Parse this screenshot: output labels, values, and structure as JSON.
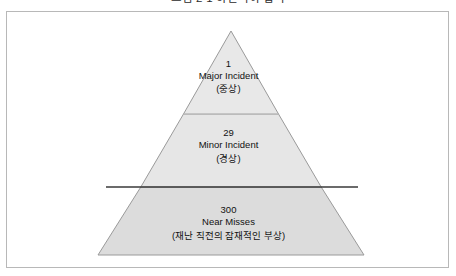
{
  "top_caption": {
    "text": "그림 2-1  하인리히 법칙",
    "note": "clipped-at-top-edge"
  },
  "figure": {
    "name": "heinrich-safety-pyramid",
    "background": "#ffffff",
    "border_color": "#b8b8b8"
  },
  "pyramid": {
    "apex": {
      "x": 230,
      "y": 19
    },
    "base": {
      "left_x": 91,
      "right_x": 357,
      "y": 243
    },
    "divider_y": [
      102,
      175
    ],
    "tiers": [
      {
        "id": "major-incident",
        "count": "1",
        "label": "Major Incident",
        "sub": "(중상)",
        "fill": "#e8e8e8"
      },
      {
        "id": "minor-incident",
        "count": "29",
        "label": "Minor Incident",
        "sub": "(경상)",
        "fill": "#e6e6e6"
      },
      {
        "id": "near-misses",
        "count": "300",
        "label": "Near Misses",
        "sub": "(재난 직전의 잠재적인 부상)",
        "fill": "#dcdcdc"
      }
    ],
    "outline_color": "#9a9a9a",
    "inner_divider_color": "#c9c9c9"
  },
  "threshold_rule": {
    "id": "threshold-line",
    "y": 175,
    "x_start": 99,
    "x_end": 351,
    "color": "#3a3a3a",
    "width": 1.4
  }
}
